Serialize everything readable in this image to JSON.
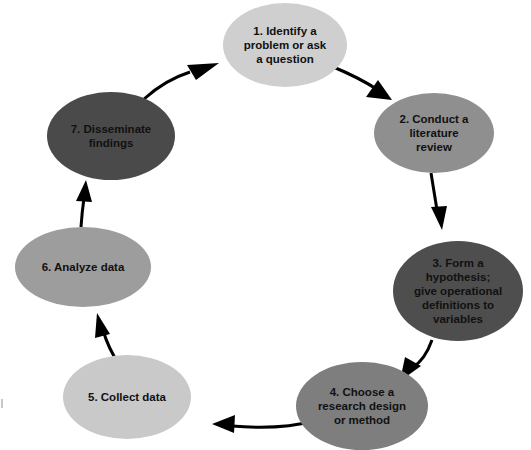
{
  "diagram": {
    "type": "cycle",
    "arrow_color": "#000000",
    "nodes": [
      {
        "id": 1,
        "lines": [
          "1. Identify a",
          "problem or ask",
          "a question"
        ],
        "color": "#cfcfcf",
        "cx": 285,
        "cy": 45,
        "rx": 62,
        "ry": 42
      },
      {
        "id": 2,
        "lines": [
          "2. Conduct a",
          "literature",
          "review"
        ],
        "color": "#8f8f8f",
        "cx": 434,
        "cy": 133,
        "rx": 60,
        "ry": 40
      },
      {
        "id": 3,
        "lines": [
          "3. Form a",
          "hypothesis;",
          "give operational",
          "definitions to",
          "variables"
        ],
        "color": "#4e4e4e",
        "cx": 458,
        "cy": 291,
        "rx": 65,
        "ry": 50
      },
      {
        "id": 4,
        "lines": [
          "4. Choose a",
          "research design",
          "or method"
        ],
        "color": "#7e7e7e",
        "cx": 362,
        "cy": 406,
        "rx": 66,
        "ry": 44
      },
      {
        "id": 5,
        "lines": [
          "5. Collect data"
        ],
        "color": "#c9c9c9",
        "cx": 127,
        "cy": 397,
        "rx": 64,
        "ry": 42
      },
      {
        "id": 6,
        "lines": [
          "6. Analyze data"
        ],
        "color": "#9d9d9d",
        "cx": 83,
        "cy": 267,
        "rx": 68,
        "ry": 40
      },
      {
        "id": 7,
        "lines": [
          "7. Disseminate",
          "findings"
        ],
        "color": "#4a4a4a",
        "cx": 111,
        "cy": 136,
        "rx": 64,
        "ry": 44
      }
    ],
    "edges": [
      {
        "from": 1,
        "to": 2
      },
      {
        "from": 2,
        "to": 3
      },
      {
        "from": 3,
        "to": 4
      },
      {
        "from": 4,
        "to": 5
      },
      {
        "from": 5,
        "to": 6
      },
      {
        "from": 6,
        "to": 7
      },
      {
        "from": 7,
        "to": 1
      }
    ]
  }
}
